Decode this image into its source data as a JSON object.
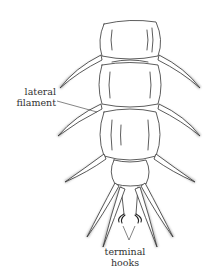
{
  "figure": {
    "labels": {
      "lateral_filament": "lateral filament",
      "terminal_hooks": "terminal hooks"
    },
    "colors": {
      "line": "#333333",
      "hair": "#888888",
      "background": "#ffffff"
    }
  }
}
